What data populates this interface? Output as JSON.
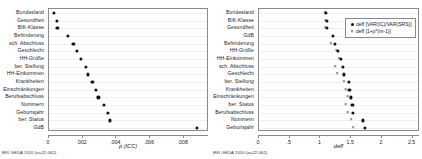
{
  "figure": {
    "footnote": "RKI GEDA 2010 (n=22.062)"
  },
  "chart_data": [
    {
      "type": "scatter",
      "panel": "left",
      "title": "",
      "xlabel": "ρ (ICC)",
      "ylabel": "",
      "xlim": [
        0,
        0.0095
      ],
      "xticks": [
        0,
        0.002,
        0.004,
        0.006,
        0.008
      ],
      "xticklabels": [
        "0",
        ".002",
        ".004",
        ".006",
        ".008"
      ],
      "grid": true,
      "legend": null,
      "categories": [
        "Bundesland",
        "Gesundheit",
        "BIK-Klasse",
        "Behinderung",
        "sch. Abschluss",
        "Geschlecht",
        "HH-Größe",
        "ber. Stellung",
        "HH-Einkommen",
        "Krankheiten",
        "Einschränkungen",
        "Berufsabschluss",
        "Nummern",
        "Geburtsjahr",
        "ber. Status",
        "GdB"
      ],
      "series": [
        {
          "name": "ρ (ICC)",
          "marker": "dot",
          "values": [
            0.00027,
            0.00045,
            0.0005,
            0.0011,
            0.00145,
            0.00168,
            0.0019,
            0.00218,
            0.00233,
            0.00258,
            0.00278,
            0.00293,
            0.00325,
            0.00348,
            0.00362,
            0.0088
          ]
        }
      ]
    },
    {
      "type": "scatter",
      "panel": "right",
      "title": "",
      "xlabel": "deff",
      "ylabel": "",
      "xlim": [
        0,
        2.62
      ],
      "xticks": [
        0,
        0.5,
        1,
        1.5,
        2,
        2.5
      ],
      "xticklabels": [
        "0",
        ".5",
        "1",
        "1.5",
        "2",
        "2.5"
      ],
      "grid": true,
      "legend": {
        "position": "top-right",
        "entries": [
          {
            "marker": "dot",
            "label": "deff [VAR(IC)/VAR(SRS)]"
          },
          {
            "marker": "cross",
            "label": "deff [1+ρ*(m-1)]"
          }
        ]
      },
      "categories": [
        "Bundesland",
        "BIK-Klasse",
        "Gesundheit",
        "GdB",
        "Behinderung",
        "HH-Größe",
        "HH-Einkommen",
        "sch. Abschluss",
        "Geschlecht",
        "ber. Stellung",
        "Krankheiten",
        "Einschränkungen",
        "ber. Status",
        "Berufsabschluss",
        "Nummern",
        "Geburtsjahr"
      ],
      "series": [
        {
          "name": "deff [VAR(IC)/VAR(SRS)]",
          "marker": "dot",
          "values": [
            1.09,
            1.1,
            1.1,
            1.2,
            1.23,
            1.28,
            1.33,
            1.36,
            1.38,
            1.46,
            1.47,
            1.5,
            1.52,
            1.53,
            1.69,
            1.73
          ]
        },
        {
          "name": "deff [1+ρ*(m-1)]",
          "marker": "cross",
          "values": [
            1.07,
            1.08,
            1.08,
            2.35,
            1.17,
            1.26,
            1.3,
            1.24,
            1.27,
            1.38,
            1.41,
            1.44,
            1.41,
            1.44,
            1.5,
            1.53
          ]
        }
      ]
    }
  ]
}
